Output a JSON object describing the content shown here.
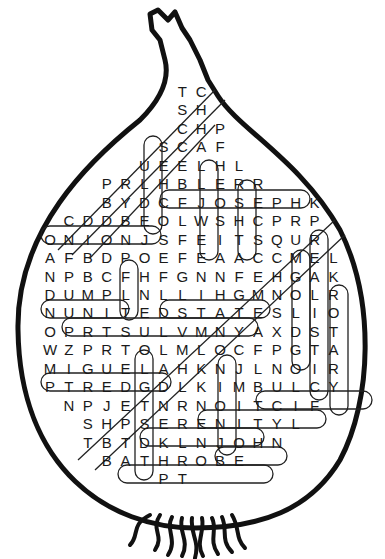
{
  "puzzle": {
    "title": "Onion Word Search",
    "grid_origin": {
      "x": 50,
      "y": 92,
      "dx": 18.9,
      "dy": 18.45
    },
    "rows": [
      {
        "col": 7,
        "text": "TC"
      },
      {
        "col": 7,
        "text": "SH"
      },
      {
        "col": 7,
        "text": "CHP"
      },
      {
        "col": 6,
        "text": "SCAF"
      },
      {
        "col": 5,
        "text": "UEELHL"
      },
      {
        "col": 3,
        "text": "PRLHBLERR"
      },
      {
        "col": 3,
        "text": "BYDCFJOSEPHK"
      },
      {
        "col": 1,
        "text": "CDDBEOLWSHCPRP"
      },
      {
        "col": 0,
        "text": "ONIONJSFEITSQUR"
      },
      {
        "col": 0,
        "text": "AFBDPOEFEAACCMEL"
      },
      {
        "col": 0,
        "text": "NPBCFHFGNNFEHGAK"
      },
      {
        "col": 0,
        "text": "DUMPLNLLIHGMNOLR"
      },
      {
        "col": 0,
        "text": "NUNITEDSTATESLIO"
      },
      {
        "col": 0,
        "text": "OPRTSULVMNYAXDST"
      },
      {
        "col": 0,
        "text": "WZPRTOLMLOCFPGTA"
      },
      {
        "col": 0,
        "text": "MIGUELAHKNJLNOIR"
      },
      {
        "col": 0,
        "text": "PTREDGDLKIMBULCY"
      },
      {
        "col": 1,
        "text": "NPJETNRNOITCIF"
      },
      {
        "col": 2,
        "text": "SHPSERENITYL"
      },
      {
        "col": 2,
        "text": "TBTDKLNJOHN"
      },
      {
        "col": 3,
        "text": "BATHROBE"
      },
      {
        "col": 6,
        "text": "PT"
      }
    ],
    "found_words": [
      "ONION",
      "JOSEPH",
      "DUMP",
      "UNITED STATES",
      "MIGUEL",
      "BULCY",
      "FICTION",
      "SERENITY",
      "JOHN",
      "BATHROBE",
      "HILL",
      "REALISTIC",
      "ROTARY",
      "MOLD",
      "CHALL",
      "HER",
      "NANA",
      "KLD",
      "OIN"
    ],
    "colors": {
      "ink": "#1a1a1a",
      "background": "#ffffff"
    }
  }
}
